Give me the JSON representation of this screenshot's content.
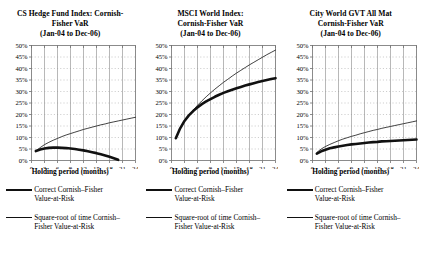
{
  "figure": {
    "axis_label": "Holding period (months)",
    "legend": {
      "correct_key": "thick-line",
      "correct_label_line1": "Correct Cornish–Fisher",
      "correct_label_line2": "Value-at-Risk",
      "sqrt_key": "thin-line",
      "sqrt_label_line1": "Square-root of time Cornish–",
      "sqrt_label_line2": "Fisher Value-at-Risk"
    },
    "colors": {
      "correct_line": "#111111",
      "sqrt_line": "#111111",
      "grid_solid": "#9a9a9a",
      "grid_dotted": "#b0b0b0",
      "axis": "#6f6f6f"
    }
  },
  "chart_data": [
    {
      "type": "line",
      "title_line1": "CS Hedge Fund Index:  Cornish-",
      "title_line2": "Fisher VaR",
      "title_line3": "(Jan-04 to Dec-06)",
      "xlabel": "Holding period (months)",
      "ylabel": "",
      "xlim": [
        0,
        24
      ],
      "ylim": [
        0,
        0.5
      ],
      "xticks": [
        0,
        3,
        6,
        9,
        12,
        15,
        18,
        21,
        24
      ],
      "xticklabels": [
        "0",
        "3",
        "6",
        "9",
        "12",
        "15",
        "18",
        "21",
        "24"
      ],
      "yticks": [
        0,
        0.05,
        0.1,
        0.15,
        0.2,
        0.25,
        0.3,
        0.35,
        0.4,
        0.45,
        0.5
      ],
      "yticklabels": [
        "0%",
        "5%",
        "10%",
        "15%",
        "20%",
        "25%",
        "30%",
        "35%",
        "40%",
        "45%",
        "50%"
      ],
      "grid": true,
      "legend_position": "below",
      "x": [
        1,
        2,
        3,
        4,
        5,
        6,
        7,
        8,
        9,
        10,
        11,
        12,
        13,
        14,
        15,
        16,
        17,
        18,
        19,
        20,
        21,
        22,
        23,
        24
      ],
      "series": [
        {
          "name": "Correct Cornish-Fisher Value-at-Risk",
          "style": "thick",
          "values": [
            0.041,
            0.048,
            0.052,
            0.055,
            0.056,
            0.056,
            0.055,
            0.054,
            0.052,
            0.05,
            0.047,
            0.044,
            0.04,
            0.036,
            0.032,
            0.027,
            0.022,
            0.016,
            0.01,
            0.003,
            null,
            null,
            null,
            null
          ]
        },
        {
          "name": "Square-root of time Cornish-Fisher Value-at-Risk",
          "style": "thin",
          "values": [
            0.04,
            0.056,
            0.069,
            0.079,
            0.088,
            0.096,
            0.104,
            0.111,
            0.117,
            0.123,
            0.129,
            0.135,
            0.14,
            0.145,
            0.15,
            0.155,
            0.159,
            0.164,
            0.168,
            0.172,
            0.176,
            0.18,
            0.184,
            0.188
          ]
        }
      ]
    },
    {
      "type": "line",
      "title_line1": "MSCI World Index:",
      "title_line2": "Cornish-Fisher VaR",
      "title_line3": "(Jan-04 to Dec-06)",
      "xlabel": "Holding period (months)",
      "ylabel": "",
      "xlim": [
        0,
        24
      ],
      "ylim": [
        0,
        0.5
      ],
      "xticks": [
        0,
        3,
        6,
        9,
        12,
        15,
        18,
        21,
        24
      ],
      "xticklabels": [
        "0",
        "3",
        "6",
        "9",
        "12",
        "15",
        "18",
        "21",
        "24"
      ],
      "yticks": [
        0,
        0.05,
        0.1,
        0.15,
        0.2,
        0.25,
        0.3,
        0.35,
        0.4,
        0.45,
        0.5
      ],
      "yticklabels": [
        "0%",
        "5%",
        "10%",
        "15%",
        "20%",
        "25%",
        "30%",
        "35%",
        "40%",
        "45%",
        "50%"
      ],
      "grid": true,
      "legend_position": "below",
      "x": [
        1,
        2,
        3,
        4,
        5,
        6,
        7,
        8,
        9,
        10,
        11,
        12,
        13,
        14,
        15,
        16,
        17,
        18,
        19,
        20,
        21,
        22,
        23,
        24
      ],
      "series": [
        {
          "name": "Correct Cornish-Fisher Value-at-Risk",
          "style": "thick",
          "values": [
            0.097,
            0.14,
            0.172,
            0.196,
            0.215,
            0.231,
            0.245,
            0.257,
            0.267,
            0.277,
            0.286,
            0.294,
            0.301,
            0.308,
            0.314,
            0.32,
            0.326,
            0.331,
            0.336,
            0.341,
            0.346,
            0.35,
            0.354,
            0.358
          ]
        },
        {
          "name": "Square-root of time Cornish-Fisher Value-at-Risk",
          "style": "thin",
          "values": [
            0.098,
            0.139,
            0.17,
            0.196,
            0.219,
            0.24,
            0.259,
            0.277,
            0.294,
            0.31,
            0.325,
            0.34,
            0.353,
            0.367,
            0.38,
            0.392,
            0.404,
            0.416,
            0.427,
            0.438,
            0.449,
            0.46,
            0.47,
            0.48
          ]
        }
      ]
    },
    {
      "type": "line",
      "title_line1": "City World GVT All Mat",
      "title_line2": "Cornish-Fisher VaR",
      "title_line3": "(Jan-04 to Dec-06)",
      "xlabel": "Holding period (months)",
      "ylabel": "",
      "xlim": [
        0,
        24
      ],
      "ylim": [
        0,
        0.5
      ],
      "xticks": [
        0,
        3,
        6,
        9,
        12,
        15,
        18,
        21,
        24
      ],
      "xticklabels": [
        "0",
        "3",
        "6",
        "9",
        "12",
        "15",
        "18",
        "21",
        "24"
      ],
      "yticks": [
        0,
        0.05,
        0.1,
        0.15,
        0.2,
        0.25,
        0.3,
        0.35,
        0.4,
        0.45,
        0.5
      ],
      "yticklabels": [
        "0%",
        "5%",
        "10%",
        "15%",
        "20%",
        "25%",
        "30%",
        "35%",
        "40%",
        "45%",
        "50%"
      ],
      "grid": true,
      "legend_position": "below",
      "x": [
        1,
        2,
        3,
        4,
        5,
        6,
        7,
        8,
        9,
        10,
        11,
        12,
        13,
        14,
        15,
        16,
        17,
        18,
        19,
        20,
        21,
        22,
        23,
        24
      ],
      "series": [
        {
          "name": "Correct Cornish-Fisher Value-at-Risk",
          "style": "thick",
          "values": [
            0.03,
            0.04,
            0.047,
            0.053,
            0.057,
            0.061,
            0.064,
            0.067,
            0.07,
            0.072,
            0.074,
            0.076,
            0.078,
            0.08,
            0.081,
            0.083,
            0.084,
            0.085,
            0.086,
            0.087,
            0.088,
            0.089,
            0.09,
            0.091
          ]
        },
        {
          "name": "Square-root of time Cornish-Fisher Value-at-Risk",
          "style": "thin",
          "values": [
            0.035,
            0.05,
            0.061,
            0.07,
            0.078,
            0.086,
            0.093,
            0.099,
            0.105,
            0.11,
            0.116,
            0.121,
            0.126,
            0.131,
            0.135,
            0.14,
            0.144,
            0.148,
            0.152,
            0.156,
            0.16,
            0.164,
            0.168,
            0.172
          ]
        }
      ]
    }
  ]
}
